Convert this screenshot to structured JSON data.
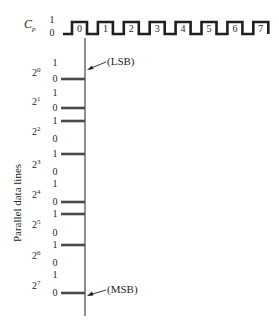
{
  "clock": {
    "label": "C",
    "label_sub": "p",
    "level_high": "1",
    "level_low": "0",
    "pulses": [
      "0",
      "1",
      "2",
      "3",
      "4",
      "5",
      "6",
      "7"
    ]
  },
  "axis_title": "Parallel data lines",
  "annotations": {
    "lsb": "(LSB)",
    "msb": "(MSB)"
  },
  "data_lines": [
    {
      "base": "2",
      "exponent": "0",
      "high": "1",
      "low": "0",
      "bit": 0
    },
    {
      "base": "2",
      "exponent": "1",
      "high": "1",
      "low": "0",
      "bit": 0
    },
    {
      "base": "2",
      "exponent": "2",
      "high": "1",
      "low": "0",
      "bit": 1
    },
    {
      "base": "2",
      "exponent": "3",
      "high": "1",
      "low": "0",
      "bit": 1
    },
    {
      "base": "2",
      "exponent": "4",
      "high": "1",
      "low": "0",
      "bit": 0
    },
    {
      "base": "2",
      "exponent": "5",
      "high": "1",
      "low": "0",
      "bit": 1
    },
    {
      "base": "2",
      "exponent": "6",
      "high": "1",
      "low": "0",
      "bit": 1
    },
    {
      "base": "2",
      "exponent": "7",
      "high": "1",
      "low": "0",
      "bit": 0
    }
  ],
  "colors": {
    "ink": "#231f20",
    "bar": "#4a4a4a"
  }
}
